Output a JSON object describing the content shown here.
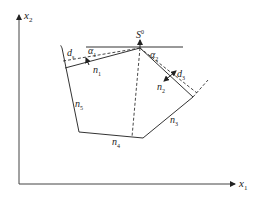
{
  "diagram": {
    "type": "polygon-geometry",
    "axes": {
      "x_label": "x",
      "x_sub": "1",
      "y_label": "x",
      "y_sub": "2"
    },
    "apex": {
      "label": "S",
      "sup": "0"
    },
    "angles": [
      {
        "label": "α",
        "sub": "1"
      },
      {
        "label": "α",
        "sub": "2"
      }
    ],
    "offsets": [
      {
        "label": "d",
        "sub": "s"
      },
      {
        "label": "d",
        "sub": "3"
      }
    ],
    "normals": [
      {
        "label": "n",
        "sub": "1"
      },
      {
        "label": "n",
        "sub": "2"
      },
      {
        "label": "n",
        "sub": "3"
      },
      {
        "label": "n",
        "sub": "4"
      },
      {
        "label": "n",
        "sub": "5"
      }
    ],
    "colors": {
      "line": "#333333",
      "background": "#ffffff"
    }
  }
}
